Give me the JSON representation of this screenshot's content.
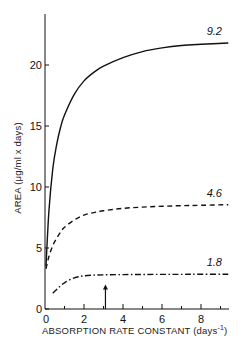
{
  "chart_data": {
    "type": "line",
    "title": "",
    "xlabel": "ABSORPTION RATE CONSTANT (days⁻¹)",
    "xlabel_main": "ABSORPTION RATE CONSTANT (days",
    "xlabel_sup": "-1",
    "xlabel_close": ")",
    "ylabel": "AREA (μg/ml x days)",
    "xlim": [
      0,
      9.4
    ],
    "ylim": [
      0,
      24
    ],
    "xticks": [
      0,
      2,
      4,
      6,
      8
    ],
    "xtick_labels": [
      "0",
      "2",
      "4",
      "6",
      "8"
    ],
    "xminor_ticks": [
      1,
      3,
      5,
      7,
      9
    ],
    "yticks": [
      0,
      5,
      10,
      15,
      20
    ],
    "ytick_labels": [
      "0",
      "5",
      "10",
      "15",
      "20"
    ],
    "grid": false,
    "legend": "inline labels at right end of each curve",
    "annotations": [
      {
        "type": "arrow",
        "x": 3.1,
        "y_from": 0,
        "y_to": 2.0,
        "direction": "up"
      }
    ],
    "series": [
      {
        "name": "9.2",
        "style": "solid",
        "x": [
          0.05,
          0.2,
          0.4,
          0.6,
          0.8,
          1.0,
          1.5,
          2.0,
          2.5,
          3.0,
          4.0,
          5.0,
          6.0,
          7.0,
          8.0,
          9.4
        ],
        "values": [
          3.5,
          8.0,
          11.5,
          13.5,
          14.9,
          15.9,
          17.6,
          18.7,
          19.4,
          19.9,
          20.6,
          21.1,
          21.4,
          21.6,
          21.7,
          21.8
        ]
      },
      {
        "name": "4.6",
        "style": "dashed",
        "x": [
          0.05,
          0.2,
          0.4,
          0.6,
          0.8,
          1.0,
          1.5,
          2.0,
          2.5,
          3.0,
          4.0,
          5.0,
          6.0,
          7.0,
          8.0,
          9.4
        ],
        "values": [
          3.3,
          4.3,
          5.2,
          5.8,
          6.3,
          6.7,
          7.3,
          7.7,
          7.9,
          8.05,
          8.25,
          8.35,
          8.42,
          8.47,
          8.5,
          8.55
        ]
      },
      {
        "name": "1.8",
        "style": "dash-dot",
        "x": [
          0.4,
          0.6,
          0.8,
          1.0,
          1.5,
          2.0,
          2.5,
          3.0,
          4.0,
          5.0,
          6.0,
          7.0,
          8.0,
          9.4
        ],
        "values": [
          1.3,
          1.6,
          1.9,
          2.15,
          2.55,
          2.72,
          2.78,
          2.8,
          2.82,
          2.83,
          2.84,
          2.84,
          2.85,
          2.85
        ]
      }
    ]
  }
}
